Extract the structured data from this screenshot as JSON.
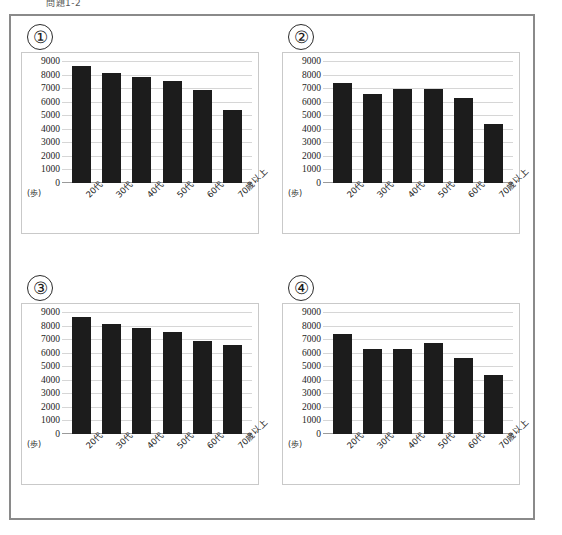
{
  "top_caption": "問題1-2",
  "panels": [
    {
      "number": "①",
      "name": "chart-1"
    },
    {
      "number": "②",
      "name": "chart-2"
    },
    {
      "number": "③",
      "name": "chart-3"
    },
    {
      "number": "④",
      "name": "chart-4"
    }
  ],
  "axis": {
    "unit_label": "(歩)",
    "y_ticks": [
      9000,
      8000,
      7000,
      6000,
      5000,
      4000,
      3000,
      2000,
      1000,
      0
    ],
    "categories": [
      "20代",
      "30代",
      "40代",
      "50代",
      "60代",
      "70歳以上"
    ]
  },
  "colors": {
    "bar": "#1c1c1c",
    "gridline": "#d6d6d6",
    "panel_border": "#c9c9c9",
    "outer_border": "#8a8a8a",
    "text": "#1d1d1d"
  },
  "chart_data": [
    {
      "type": "bar",
      "id": "chart-1",
      "title": "①",
      "categories": [
        "20代",
        "30代",
        "40代",
        "50代",
        "60代",
        "70歳以上"
      ],
      "values": [
        8600,
        8150,
        7850,
        7550,
        6850,
        5400
      ],
      "xlabel": "",
      "ylabel": "(歩)",
      "ylim": [
        0,
        9000
      ],
      "yticks": [
        0,
        1000,
        2000,
        3000,
        4000,
        5000,
        6000,
        7000,
        8000,
        9000
      ],
      "grid": true,
      "legend": "none"
    },
    {
      "type": "bar",
      "id": "chart-2",
      "title": "②",
      "categories": [
        "20代",
        "30代",
        "40代",
        "50代",
        "60代",
        "70歳以上"
      ],
      "values": [
        7400,
        6550,
        6900,
        6950,
        6250,
        4350
      ],
      "xlabel": "",
      "ylabel": "(歩)",
      "ylim": [
        0,
        9000
      ],
      "yticks": [
        0,
        1000,
        2000,
        3000,
        4000,
        5000,
        6000,
        7000,
        8000,
        9000
      ],
      "grid": true,
      "legend": "none"
    },
    {
      "type": "bar",
      "id": "chart-3",
      "title": "③",
      "categories": [
        "20代",
        "30代",
        "40代",
        "50代",
        "60代",
        "70歳以上"
      ],
      "values": [
        8600,
        8150,
        7850,
        7550,
        6850,
        6600
      ],
      "xlabel": "",
      "ylabel": "(歩)",
      "ylim": [
        0,
        9000
      ],
      "yticks": [
        0,
        1000,
        2000,
        3000,
        4000,
        5000,
        6000,
        7000,
        8000,
        9000
      ],
      "grid": true,
      "legend": "none"
    },
    {
      "type": "bar",
      "id": "chart-4",
      "title": "④",
      "categories": [
        "20代",
        "30代",
        "40代",
        "50代",
        "60代",
        "70歳以上"
      ],
      "values": [
        7400,
        6250,
        6250,
        6750,
        5600,
        4350
      ],
      "xlabel": "",
      "ylabel": "(歩)",
      "ylim": [
        0,
        9000
      ],
      "yticks": [
        0,
        1000,
        2000,
        3000,
        4000,
        5000,
        6000,
        7000,
        8000,
        9000
      ],
      "grid": true,
      "legend": "none"
    }
  ]
}
